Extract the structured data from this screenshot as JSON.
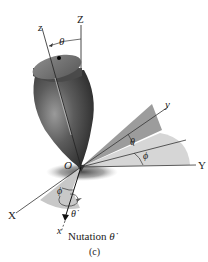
{
  "figure": {
    "caption_label": "(c)",
    "title": "Nutation",
    "title_symbol": "θ̇"
  },
  "axes": {
    "fixed": {
      "X": "X",
      "Y": "Y",
      "Z": "Z"
    },
    "body": {
      "x": "x",
      "y": "y",
      "z": "z"
    },
    "origin": "O"
  },
  "angles": {
    "theta_top": "θ",
    "theta_right": "θ",
    "phi_right": "ϕ",
    "phi_left": "ϕ",
    "theta_dot": "θ̇"
  },
  "colors": {
    "top_body": "#5a5a5a",
    "shaded_plane_dark": "#9a9a9a",
    "shaded_plane_light": "#d4d4d4",
    "shadow": "#6a6a6a",
    "axis_line": "#333333"
  }
}
